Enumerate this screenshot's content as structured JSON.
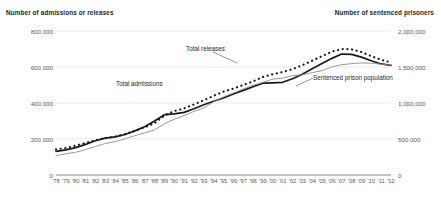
{
  "chart_data": {
    "type": "line",
    "title": "",
    "xlabel": "",
    "ylabel": "Number of admissions or releases",
    "y2label": "Number of sentenced prisoners",
    "grid": true,
    "legend_position": "inline-annotations",
    "x": [
      "'78",
      "'79",
      "'80",
      "'81",
      "'82",
      "'83",
      "'84",
      "'85",
      "'86",
      "'87",
      "'88",
      "'89",
      "'90",
      "'91",
      "'92",
      "'93",
      "'94",
      "'95",
      "'96",
      "'97",
      "'98",
      "'99",
      "'00",
      "'01",
      "'02",
      "'03",
      "'04",
      "'05",
      "'06",
      "'07",
      "'08",
      "'09",
      "'10",
      "'11",
      "'12"
    ],
    "ylim": [
      0,
      800000
    ],
    "yticks": [
      0,
      200000,
      400000,
      600000,
      800000
    ],
    "ytick_labels": [
      "0",
      "200,000",
      "400,000",
      "600,000",
      "800,000"
    ],
    "y2lim": [
      0,
      2000000
    ],
    "y2ticks": [
      0,
      500000,
      1000000,
      1500000,
      2000000
    ],
    "y2tick_labels": [
      "0",
      "500,000",
      "1,000,000",
      "1,500,000",
      "2,000,000"
    ],
    "series": [
      {
        "name": "Total releases",
        "axis": "left",
        "style": "dotted",
        "color": "#1a1a1a",
        "values": [
          142000,
          150000,
          163000,
          178000,
          193000,
          205000,
          213000,
          227000,
          245000,
          265000,
          288000,
          330000,
          355000,
          370000,
          392000,
          415000,
          440000,
          463000,
          480000,
          500000,
          520000,
          545000,
          560000,
          572000,
          588000,
          610000,
          635000,
          660000,
          685000,
          700000,
          698000,
          683000,
          660000,
          640000,
          625000
        ]
      },
      {
        "name": "Total admissions",
        "axis": "left",
        "style": "solid-thick",
        "color": "#1a1a1a",
        "values": [
          131000,
          140000,
          152000,
          170000,
          190000,
          205000,
          212000,
          225000,
          245000,
          268000,
          300000,
          335000,
          340000,
          348000,
          368000,
          390000,
          410000,
          428000,
          450000,
          470000,
          490000,
          510000,
          512000,
          515000,
          535000,
          560000,
          590000,
          620000,
          648000,
          672000,
          670000,
          655000,
          635000,
          617000,
          609000
        ]
      },
      {
        "name": "Sentenced prison population",
        "axis": "right",
        "style": "solid-thin",
        "color": "#8c8c8c",
        "values": [
          268000,
          295000,
          316000,
          353000,
          395000,
          437000,
          463000,
          503000,
          546000,
          585000,
          627000,
          712000,
          774000,
          825000,
          884000,
          932000,
          1017000,
          1085000,
          1138000,
          1195000,
          1246000,
          1287000,
          1331000,
          1345000,
          1380000,
          1392000,
          1421000,
          1449000,
          1502000,
          1532000,
          1547000,
          1556000,
          1552000,
          1539000,
          1524000
        ]
      }
    ]
  }
}
